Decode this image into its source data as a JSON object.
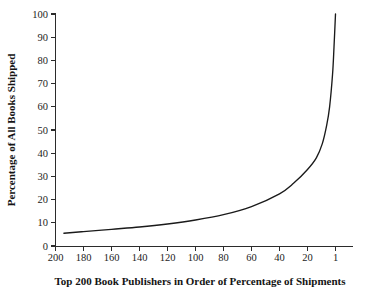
{
  "chart_data": {
    "type": "line",
    "title": "",
    "xlabel": "Top 200 Book Publishers in Order of Percentage of Shipments",
    "ylabel": "Percentage of All Books Shipped",
    "xtick_labels": [
      "200",
      "180",
      "160",
      "140",
      "120",
      "100",
      "80",
      "60",
      "40",
      "20",
      "1"
    ],
    "xtick_values": [
      200,
      180,
      160,
      140,
      120,
      100,
      80,
      60,
      40,
      20,
      1
    ],
    "ytick_labels": [
      "0",
      "10",
      "20",
      "30",
      "40",
      "50",
      "60",
      "70",
      "80",
      "90",
      "100"
    ],
    "ytick_values": [
      0,
      10,
      20,
      30,
      40,
      50,
      60,
      70,
      80,
      90,
      100
    ],
    "xlim": [
      200,
      1
    ],
    "ylim": [
      0,
      100
    ],
    "x_axis_inverted": true,
    "grid": false,
    "legend": false,
    "series": [
      {
        "name": "Cumulative percentage of all books shipped",
        "x": [
          194,
          180,
          160,
          140,
          120,
          100,
          80,
          60,
          40,
          30,
          20,
          14,
          10,
          7,
          5,
          3,
          2,
          1
        ],
        "values": [
          5.5,
          6.2,
          7.2,
          8.2,
          9.5,
          11.2,
          13.5,
          17.0,
          22.5,
          27.0,
          33.0,
          38.0,
          44.0,
          52.0,
          60.0,
          74.0,
          86.0,
          100.0
        ]
      }
    ],
    "annotations": [],
    "line_color": "#1a1a1a",
    "background_color": "#ffffff"
  },
  "figure": {
    "width": 367,
    "height": 296
  }
}
